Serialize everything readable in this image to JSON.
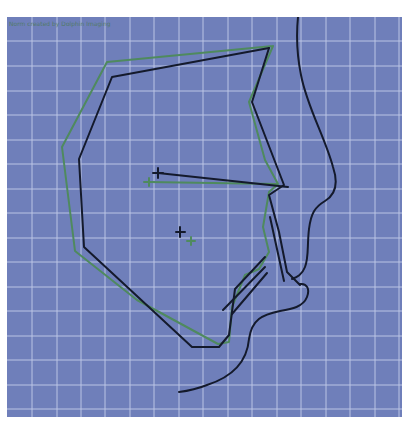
{
  "diagram": {
    "type": "cephalometric-superimposition",
    "caption": "Norm created by Dolphin Imaging",
    "colors": {
      "background": "#6f7fba",
      "grid": "#c5cdea",
      "patient_tracing": "#141a2c",
      "norm_tracing": "#4f8a5e",
      "profile": "#141a2c"
    },
    "grid": {
      "spacing_px": 24.5,
      "origin_x": 25,
      "origin_y": 24
    },
    "legend": [
      {
        "label": "Patient tracing",
        "color": "#141a2c"
      },
      {
        "label": "Norm tracing",
        "color": "#4f8a5e"
      }
    ]
  }
}
